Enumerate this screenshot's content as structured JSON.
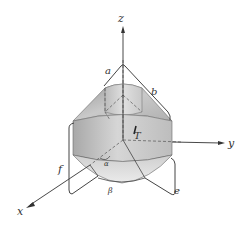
{
  "figure": {
    "axes": {
      "x_label": "x",
      "y_label": "y",
      "z_label": "z"
    },
    "labels": {
      "a": "a",
      "b": "b",
      "e": "e",
      "f": "f",
      "T": "T",
      "alpha": "α",
      "beta": "β"
    },
    "colors": {
      "background": "#ffffff",
      "line": "#4a4a4a",
      "surface_light": "#e6e6e6",
      "surface_mid": "#c4c4c4",
      "surface_dark": "#9c9c9c"
    }
  }
}
